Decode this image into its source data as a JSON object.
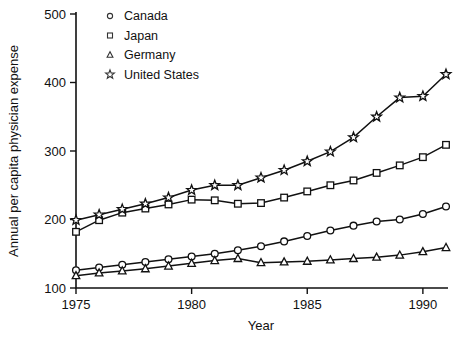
{
  "chart_data": {
    "type": "line",
    "title": "",
    "xlabel": "Year",
    "ylabel": "Annual per capita physician expense",
    "xlim": [
      1975,
      1991
    ],
    "ylim": [
      100,
      500
    ],
    "xticks": [
      1975,
      1980,
      1985,
      1990
    ],
    "yticks": [
      100,
      200,
      300,
      400,
      500
    ],
    "xtick_labels": [
      "1975",
      "1980",
      "1985",
      "1990"
    ],
    "ytick_labels": [
      "100",
      "200",
      "300",
      "400",
      "500"
    ],
    "grid": false,
    "legend_position": "top-left-inside",
    "x": [
      1975,
      1976,
      1977,
      1978,
      1979,
      1980,
      1981,
      1982,
      1983,
      1984,
      1985,
      1986,
      1987,
      1988,
      1989,
      1990,
      1991
    ],
    "series": [
      {
        "name": "Canada",
        "marker": "circle",
        "values": [
          126,
          130,
          134,
          138,
          142,
          146,
          150,
          155,
          161,
          168,
          176,
          184,
          191,
          197,
          200,
          208,
          219
        ]
      },
      {
        "name": "Japan",
        "marker": "square",
        "values": [
          182,
          199,
          210,
          216,
          222,
          229,
          228,
          223,
          224,
          232,
          241,
          250,
          257,
          268,
          279,
          291,
          309
        ]
      },
      {
        "name": "Germany",
        "marker": "triangle",
        "values": [
          118,
          122,
          125,
          128,
          132,
          136,
          140,
          143,
          137,
          138,
          139,
          141,
          143,
          145,
          148,
          153,
          159
        ]
      },
      {
        "name": "United States",
        "marker": "star",
        "values": [
          199,
          207,
          215,
          223,
          232,
          243,
          250,
          250,
          261,
          272,
          285,
          299,
          320,
          350,
          378,
          380,
          412
        ]
      }
    ],
    "legend_entries": [
      "Canada",
      "Japan",
      "Germany",
      "United States"
    ],
    "colors": {
      "line": "#111111",
      "marker_fill": "#ffffff",
      "axis": "#111111",
      "background": "#ffffff"
    }
  }
}
